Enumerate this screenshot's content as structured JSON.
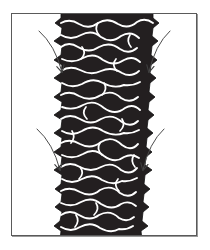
{
  "figure": {
    "title": "Tire tread pattern detail",
    "background_color": "#ffffff",
    "frame": {
      "border_color": "#5a5a5a",
      "shadow_color": "#9a9a9a",
      "x": 11,
      "y": 13,
      "width": 186,
      "height": 223
    },
    "tread": {
      "label": "tire-tread-band",
      "fill_color": "#231f20",
      "sipe_color": "#ffffff",
      "outline_color": "#000000",
      "description": "Vertical dark tire tread band with wavy lateral sipe grooves and scalloped shoulder lugs, cropped at top and bottom of frame",
      "top_left_x": 49,
      "top_right_x": 137,
      "bottom_left_x": 47,
      "bottom_right_x": 129,
      "rows": 14
    },
    "annotations": {
      "arrow_color": "#4c4c4c",
      "arrow_width": 1,
      "items": [
        {
          "name": "arrow-upper-left",
          "tail_x": 27,
          "tail_y": 17,
          "head_x": 51,
          "head_y": 59,
          "direction": "down-right"
        },
        {
          "name": "arrow-upper-right",
          "tail_x": 158,
          "tail_y": 17,
          "head_x": 137,
          "head_y": 59,
          "direction": "down-left"
        },
        {
          "name": "arrow-lower-left",
          "tail_x": 25,
          "tail_y": 115,
          "head_x": 49,
          "head_y": 157,
          "direction": "down-right"
        },
        {
          "name": "arrow-lower-right",
          "tail_x": 152,
          "tail_y": 115,
          "head_x": 131,
          "head_y": 157,
          "direction": "down-left"
        }
      ]
    }
  }
}
